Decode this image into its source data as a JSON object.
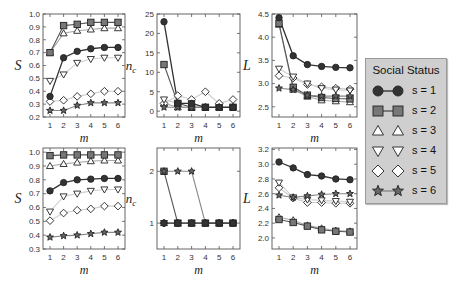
{
  "chart_data": [
    {
      "id": "top-left",
      "type": "line",
      "ylabel": "S",
      "xlabel": "m",
      "x": [
        1,
        2,
        3,
        4,
        5,
        6
      ],
      "ylim": [
        0.2,
        1.0
      ],
      "yticks": [
        0.2,
        0.3,
        0.4,
        0.5,
        0.6,
        0.7,
        0.8,
        0.9,
        1.0
      ],
      "ytick_labels": [
        "0.2",
        "0.3",
        "0.4",
        "0.5",
        "0.6",
        "0.7",
        "0.8",
        "0.9",
        "1.0"
      ],
      "series": [
        {
          "name": "s = 1",
          "values": [
            0.36,
            0.66,
            0.71,
            0.73,
            0.74,
            0.74
          ]
        },
        {
          "name": "s = 2",
          "values": [
            0.7,
            0.91,
            0.92,
            0.935,
            0.935,
            0.935
          ]
        },
        {
          "name": "s = 3",
          "values": [
            0.7,
            0.85,
            0.87,
            0.88,
            0.89,
            0.89
          ]
        },
        {
          "name": "s = 4",
          "values": [
            0.48,
            0.53,
            0.62,
            0.65,
            0.66,
            0.66
          ]
        },
        {
          "name": "s = 5",
          "values": [
            0.32,
            0.33,
            0.36,
            0.38,
            0.4,
            0.4
          ]
        },
        {
          "name": "s = 6",
          "values": [
            0.25,
            0.25,
            0.29,
            0.31,
            0.31,
            0.31
          ]
        }
      ]
    },
    {
      "id": "top-middle",
      "type": "line",
      "ylabel": "n_c",
      "xlabel": "m",
      "x": [
        1,
        2,
        3,
        4,
        5,
        6
      ],
      "ylim": [
        -1.5,
        25
      ],
      "yticks": [
        0,
        5,
        10,
        15,
        20,
        25
      ],
      "ytick_labels": [
        "0",
        "5",
        "10",
        "15",
        "20",
        "25"
      ],
      "series": [
        {
          "name": "s = 1",
          "values": [
            23,
            2,
            2,
            1,
            1,
            1
          ]
        },
        {
          "name": "s = 2",
          "values": [
            12,
            2,
            1,
            1,
            1,
            1
          ]
        },
        {
          "name": "s = 3",
          "values": [
            2,
            1,
            1,
            1,
            1,
            1
          ]
        },
        {
          "name": "s = 4",
          "values": [
            3,
            2,
            2,
            1,
            1,
            1
          ]
        },
        {
          "name": "s = 5",
          "values": [
            2,
            4,
            3,
            5,
            2,
            3
          ]
        },
        {
          "name": "s = 6",
          "values": [
            1,
            1,
            1,
            1,
            1,
            1
          ]
        }
      ]
    },
    {
      "id": "top-right",
      "type": "line",
      "ylabel": "L",
      "xlabel": "m",
      "x": [
        1,
        2,
        3,
        4,
        5,
        6
      ],
      "ylim": [
        2.28,
        4.5
      ],
      "yticks": [
        2.5,
        3.0,
        3.5,
        4.0,
        4.5
      ],
      "ytick_labels": [
        "2.5",
        "3.0",
        "3.5",
        "4.0",
        "4.5"
      ],
      "series": [
        {
          "name": "s = 1",
          "values": [
            4.42,
            3.6,
            3.41,
            3.37,
            3.35,
            3.34
          ]
        },
        {
          "name": "s = 2",
          "values": [
            4.3,
            2.92,
            2.75,
            2.7,
            2.68,
            2.67
          ]
        },
        {
          "name": "s = 3",
          "values": [
            4.27,
            2.87,
            2.72,
            2.64,
            2.62,
            2.6
          ]
        },
        {
          "name": "s = 4",
          "values": [
            3.32,
            3.15,
            3.0,
            2.9,
            2.87,
            2.85
          ]
        },
        {
          "name": "s = 5",
          "values": [
            3.17,
            3.12,
            2.98,
            2.93,
            2.9,
            2.88
          ]
        },
        {
          "name": "s = 6",
          "values": [
            2.9,
            2.87,
            2.75,
            2.73,
            2.73,
            2.73
          ]
        }
      ]
    },
    {
      "id": "bottom-left",
      "type": "line",
      "ylabel": "S",
      "xlabel": "m",
      "x": [
        1,
        2,
        3,
        4,
        5,
        6
      ],
      "ylim": [
        0.3,
        1.03
      ],
      "yticks": [
        0.3,
        0.4,
        0.5,
        0.6,
        0.7,
        0.8,
        0.9,
        1.0
      ],
      "ytick_labels": [
        "0.3",
        "0.4",
        "0.5",
        "0.6",
        "0.7",
        "0.8",
        "0.9",
        "1.0"
      ],
      "series": [
        {
          "name": "s = 1",
          "values": [
            0.72,
            0.78,
            0.8,
            0.805,
            0.81,
            0.81
          ]
        },
        {
          "name": "s = 2",
          "values": [
            0.975,
            0.98,
            0.98,
            0.98,
            0.98,
            0.98
          ]
        },
        {
          "name": "s = 3",
          "values": [
            0.9,
            0.915,
            0.925,
            0.935,
            0.94,
            0.94
          ]
        },
        {
          "name": "s = 4",
          "values": [
            0.57,
            0.68,
            0.7,
            0.72,
            0.73,
            0.73
          ]
        },
        {
          "name": "s = 5",
          "values": [
            0.505,
            0.56,
            0.58,
            0.59,
            0.61,
            0.61
          ]
        },
        {
          "name": "s = 6",
          "values": [
            0.385,
            0.395,
            0.4,
            0.41,
            0.42,
            0.42
          ]
        }
      ]
    },
    {
      "id": "bottom-middle",
      "type": "line",
      "ylabel": "n_c",
      "xlabel": "m",
      "x": [
        1,
        2,
        3,
        4,
        5,
        6
      ],
      "ylim": [
        0.5,
        2.45
      ],
      "yticks": [
        1,
        2
      ],
      "ytick_labels": [
        "1",
        "2"
      ],
      "series": [
        {
          "name": "s = 1",
          "values": [
            1,
            1,
            1,
            1,
            1,
            1
          ]
        },
        {
          "name": "s = 2",
          "values": [
            2,
            1,
            1,
            1,
            1,
            1
          ]
        },
        {
          "name": "s = 3",
          "values": [
            1,
            1,
            1,
            1,
            1,
            1
          ]
        },
        {
          "name": "s = 4",
          "values": [
            1,
            1,
            1,
            1,
            1,
            1
          ]
        },
        {
          "name": "s = 5",
          "values": [
            1,
            1,
            1,
            1,
            1,
            1
          ]
        },
        {
          "name": "s = 6",
          "values": [
            2,
            2,
            2,
            1,
            1,
            1
          ]
        }
      ]
    },
    {
      "id": "bottom-right",
      "type": "line",
      "ylabel": "L",
      "xlabel": "m",
      "x": [
        1,
        2,
        3,
        4,
        5,
        6
      ],
      "ylim": [
        1.85,
        3.22
      ],
      "yticks": [
        2.0,
        2.2,
        2.4,
        2.6,
        2.8,
        3.0,
        3.2
      ],
      "ytick_labels": [
        "2.0",
        "2.2",
        "2.4",
        "2.6",
        "2.8",
        "3.0",
        "3.2"
      ],
      "series": [
        {
          "name": "s = 1",
          "values": [
            3.03,
            2.95,
            2.86,
            2.84,
            2.8,
            2.79
          ]
        },
        {
          "name": "s = 2",
          "values": [
            2.25,
            2.21,
            2.16,
            2.11,
            2.09,
            2.08
          ]
        },
        {
          "name": "s = 3",
          "values": [
            2.28,
            2.24,
            2.17,
            2.13,
            2.1,
            2.09
          ]
        },
        {
          "name": "s = 4",
          "values": [
            2.75,
            2.55,
            2.52,
            2.51,
            2.5,
            2.49
          ]
        },
        {
          "name": "s = 5",
          "values": [
            2.68,
            2.54,
            2.48,
            2.48,
            2.47,
            2.47
          ]
        },
        {
          "name": "s = 6",
          "values": [
            2.58,
            2.55,
            2.57,
            2.59,
            2.6,
            2.6
          ]
        }
      ]
    }
  ],
  "legend": {
    "title": "Social Status",
    "items": [
      {
        "label": "s = 1",
        "marker": "circle-filled",
        "color": "#333333",
        "line": "#333333"
      },
      {
        "label": "s = 2",
        "marker": "square-filled",
        "color": "#777777",
        "line": "#555555"
      },
      {
        "label": "s = 3",
        "marker": "triangle-up-open",
        "color": "#555555",
        "line": "#aaaaaa"
      },
      {
        "label": "s = 4",
        "marker": "triangle-down-open",
        "color": "#555555",
        "line": "#d0d0d0"
      },
      {
        "label": "s = 5",
        "marker": "diamond-open",
        "color": "#555555",
        "line": "#cccccc"
      },
      {
        "label": "s = 6",
        "marker": "star-filled",
        "color": "#666666",
        "line": "#888888"
      }
    ]
  },
  "xtick_labels": [
    "1",
    "2",
    "3",
    "4",
    "5",
    "6"
  ]
}
